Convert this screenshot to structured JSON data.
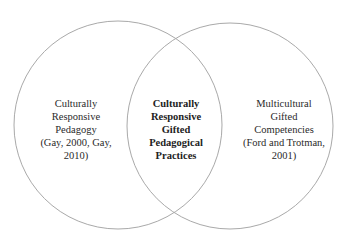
{
  "diagram": {
    "type": "venn",
    "circles": [
      {
        "id": "left",
        "cx": 118,
        "cy": 125,
        "r": 104,
        "stroke": "#a9a9a9",
        "label_lines": [
          "Culturally",
          "Responsive",
          "Pedagogy",
          "(Gay, 2000, Gay,",
          "2010)"
        ]
      },
      {
        "id": "right",
        "cx": 230,
        "cy": 126,
        "r": 103,
        "stroke": "#a9a9a9",
        "label_lines": [
          "Multicultural",
          "Gifted",
          "Competencies",
          "(Ford and Trotman,",
          "2001)"
        ]
      }
    ],
    "intersection": {
      "label_lines": [
        "Culturally",
        "Responsive",
        "Gifted",
        "Pedagogical",
        "Practices"
      ]
    }
  }
}
